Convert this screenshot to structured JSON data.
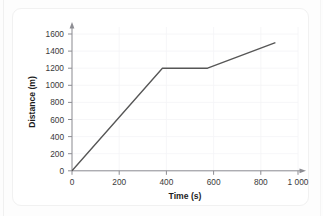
{
  "chart_data": {
    "type": "line",
    "title": "",
    "xlabel": "Time (s)",
    "ylabel": "Distance (m)",
    "xlim": [
      0,
      1000
    ],
    "ylim": [
      0,
      1700
    ],
    "grid": true,
    "legend": "none",
    "x_ticks": [
      0,
      200,
      400,
      600,
      800,
      1000
    ],
    "x_tick_labels": [
      "0",
      "200",
      "400",
      "600",
      "800",
      "1 000"
    ],
    "y_ticks": [
      0,
      200,
      400,
      600,
      800,
      1000,
      1200,
      1400,
      1600
    ],
    "y_tick_labels": [
      "0",
      "200",
      "400",
      "600",
      "800",
      "1000",
      "1200",
      "1400",
      "1600"
    ],
    "series": [
      {
        "name": "distance",
        "color": "#565656",
        "x": [
          0,
          400,
          600,
          900
        ],
        "y": [
          0,
          1200,
          1200,
          1500
        ],
        "points": [
          {
            "x": 0,
            "y": 0
          },
          {
            "x": 400,
            "y": 1200
          },
          {
            "x": 600,
            "y": 1200
          },
          {
            "x": 900,
            "y": 1500
          }
        ]
      }
    ]
  },
  "axes": {
    "x_title": "Time (s)",
    "y_title": "Distance (m)",
    "x_labels": [
      "0",
      "200",
      "400",
      "600",
      "800",
      "1 000"
    ],
    "y_labels": [
      "0",
      "200",
      "400",
      "600",
      "800",
      "1000",
      "1200",
      "1400",
      "1600"
    ]
  },
  "colors": {
    "line": "#565656",
    "axis": "#8d8d93",
    "grid": "#f4f4f6",
    "card_background": "#ffffff",
    "page_background": "#fdfdfd"
  }
}
